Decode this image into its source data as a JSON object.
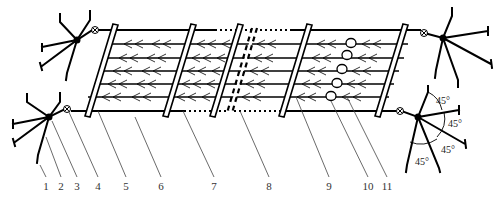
{
  "figure": {
    "type": "technical-diagram",
    "stroke_color": "#000000",
    "leader_color": "#333333",
    "background": "#ffffff"
  },
  "labels": [
    {
      "id": "1",
      "text": "1",
      "x": 46,
      "y": 188,
      "tx": 42,
      "ty": 168
    },
    {
      "id": "2",
      "text": "2",
      "x": 61,
      "y": 188,
      "tx": 48,
      "ty": 135
    },
    {
      "id": "3",
      "text": "3",
      "x": 77,
      "y": 188,
      "tx": 52,
      "ty": 122
    },
    {
      "id": "4",
      "text": "4",
      "x": 98,
      "y": 188,
      "tx": 68,
      "ty": 110
    },
    {
      "id": "5",
      "text": "5",
      "x": 126,
      "y": 188,
      "tx": 97,
      "ty": 110
    },
    {
      "id": "6",
      "text": "6",
      "x": 161,
      "y": 188,
      "tx": 134,
      "ty": 117
    },
    {
      "id": "7",
      "text": "7",
      "x": 214,
      "y": 188,
      "tx": 186,
      "ty": 110
    },
    {
      "id": "8",
      "text": "8",
      "x": 269,
      "y": 188,
      "tx": 241,
      "ty": 110
    },
    {
      "id": "9",
      "text": "9",
      "x": 329,
      "y": 188,
      "tx": 296,
      "ty": 100
    },
    {
      "id": "10",
      "text": "10",
      "x": 368,
      "y": 188,
      "tx": 331,
      "ty": 100
    },
    {
      "id": "11",
      "text": "11",
      "x": 387,
      "y": 188,
      "tx": 350,
      "ty": 100
    }
  ],
  "angles": [
    {
      "text": "45°",
      "x": 436,
      "y": 104
    },
    {
      "text": "45°",
      "x": 448,
      "y": 126
    },
    {
      "text": "45°",
      "x": 441,
      "y": 153
    },
    {
      "text": "45°",
      "x": 416,
      "y": 164
    }
  ],
  "legend_description": [
    "1 anchor",
    "2 anchor leg",
    "3 anchor hub",
    "4 shackle",
    "5 main rope",
    "6 cross bar",
    "7 connection line",
    "8 separation bar",
    "9 net line",
    "10 float",
    "11 flow direction"
  ]
}
